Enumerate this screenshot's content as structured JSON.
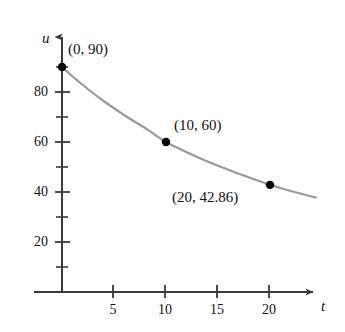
{
  "chart_data": {
    "type": "line",
    "title": "",
    "subtitle": "",
    "xlabel": "t",
    "ylabel": "u",
    "xlim": [
      0,
      25
    ],
    "ylim": [
      0,
      100
    ],
    "grid": false,
    "legend": null,
    "x_ticks": [
      5,
      10,
      15,
      20
    ],
    "x_tick_labels": [
      "5",
      "10",
      "15",
      "20"
    ],
    "x_minor_ticks": [],
    "y_ticks": [
      20,
      40,
      60,
      80
    ],
    "y_tick_labels": [
      "20",
      "40",
      "60",
      "80"
    ],
    "y_minor_ticks": [
      10,
      30,
      50,
      70,
      90
    ],
    "curve_color": "#9a9a9a",
    "point_color": "#000000",
    "axis_color": "#3a3a3a",
    "series": [
      {
        "name": "u(t)",
        "points": [
          {
            "x": 0,
            "y": 90,
            "label": "(0, 90)",
            "marked": true
          },
          {
            "x": 10,
            "y": 60,
            "label": "(10, 60)",
            "marked": true
          },
          {
            "x": 20,
            "y": 42.86,
            "label": "(20, 42.86)",
            "marked": true
          }
        ],
        "curve": [
          {
            "x": 0,
            "y": 90
          },
          {
            "x": 1,
            "y": 86.3
          },
          {
            "x": 2,
            "y": 82.8
          },
          {
            "x": 3,
            "y": 79.5
          },
          {
            "x": 4,
            "y": 76.4
          },
          {
            "x": 5,
            "y": 73.5
          },
          {
            "x": 6,
            "y": 70.7
          },
          {
            "x": 7,
            "y": 68.1
          },
          {
            "x": 8,
            "y": 65.6
          },
          {
            "x": 9,
            "y": 62.7
          },
          {
            "x": 10,
            "y": 60.0
          },
          {
            "x": 11,
            "y": 57.9
          },
          {
            "x": 12,
            "y": 55.9
          },
          {
            "x": 13,
            "y": 54.0
          },
          {
            "x": 14,
            "y": 52.2
          },
          {
            "x": 15,
            "y": 50.5
          },
          {
            "x": 16,
            "y": 48.9
          },
          {
            "x": 17,
            "y": 47.3
          },
          {
            "x": 18,
            "y": 45.8
          },
          {
            "x": 19,
            "y": 44.3
          },
          {
            "x": 20,
            "y": 42.86
          },
          {
            "x": 21,
            "y": 41.6
          },
          {
            "x": 22,
            "y": 40.4
          },
          {
            "x": 23,
            "y": 39.3
          },
          {
            "x": 24,
            "y": 38.2
          },
          {
            "x": 24.4,
            "y": 37.8
          }
        ]
      }
    ],
    "annotations": [
      {
        "text": "(0, 90)",
        "x": 0,
        "y": 90
      },
      {
        "text": "(10, 60)",
        "x": 10,
        "y": 60
      },
      {
        "text": "(20, 42.86)",
        "x": 20,
        "y": 42.86
      }
    ]
  },
  "axis_labels": {
    "y": "u",
    "x": "t"
  }
}
